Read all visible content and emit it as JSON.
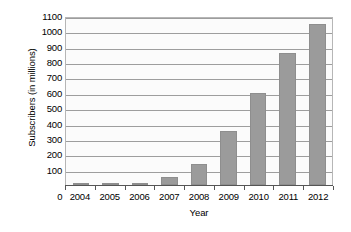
{
  "chart_data": {
    "type": "bar",
    "title": "",
    "xlabel": "Year",
    "ylabel": "Subscribers (in millions)",
    "categories": [
      "2004",
      "2005",
      "2006",
      "2007",
      "2008",
      "2009",
      "2010",
      "2011",
      "2012"
    ],
    "values": [
      2,
      4,
      11,
      55,
      140,
      350,
      600,
      860,
      1050
    ],
    "ylim": [
      0,
      1100
    ],
    "yticks": [
      1100,
      1000,
      900,
      800,
      700,
      600,
      500,
      400,
      300,
      200,
      100
    ],
    "ytick_labels": [
      "1100",
      "1000",
      "900",
      "800",
      "700",
      "600",
      "500",
      "400",
      "300",
      "200",
      "100"
    ],
    "x_origin_label": "0",
    "grid": true,
    "legend": false,
    "bar_color": "#9b9b9b",
    "grid_color": "#9d9d9d",
    "plot_background": "#fbfbfb",
    "axis_color": "#555555"
  }
}
